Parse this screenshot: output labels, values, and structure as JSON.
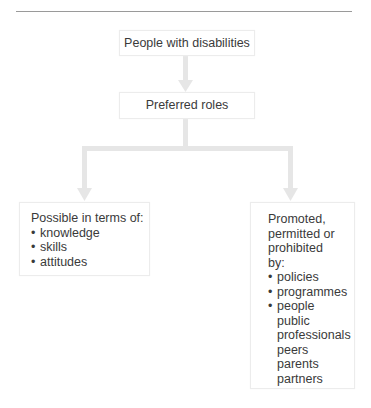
{
  "diagram": {
    "root": {
      "label": "People with disabilities"
    },
    "middle": {
      "label": "Preferred roles"
    },
    "left_branch": {
      "heading": "Possible in terms of:",
      "bullets": [
        "knowledge",
        "skills",
        "attitudes"
      ]
    },
    "right_branch": {
      "heading_lines": [
        "Promoted,",
        "permitted or",
        "prohibited",
        "by:"
      ],
      "bullets": [
        "policies",
        "programmes",
        "people"
      ],
      "sub_items": [
        "public",
        "professionals",
        "peers",
        "parents",
        "partners"
      ]
    },
    "colors": {
      "arrow": "#e4e4e4",
      "text": "#3a3a3a",
      "rule": "#9a9a9a",
      "box_border": "#ececec"
    }
  }
}
